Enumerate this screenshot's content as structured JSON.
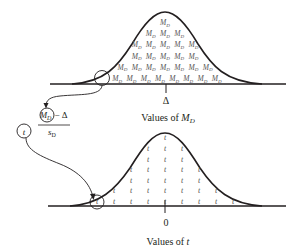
{
  "top_panel": {
    "name": "sampling-distribution-of-MD",
    "item_symbol": "M",
    "item_subscript": "D",
    "rows": [
      1,
      3,
      5,
      5,
      7,
      8
    ],
    "center_label": "Δ",
    "axis_label_prefix": "Values of ",
    "axis_label_var": "M",
    "axis_label_sub": "D"
  },
  "formula": {
    "numerator_var": "M",
    "numerator_sub": "D",
    "numerator_minus": "− Δ",
    "denominator_var": "s",
    "denominator_sub": "D",
    "result_symbol": "t"
  },
  "bottom_panel": {
    "name": "t-distribution",
    "item_symbol": "t",
    "column_heights": [
      1,
      2,
      4,
      6,
      7,
      6,
      4,
      2,
      1
    ],
    "center_label": "0",
    "axis_label_prefix": "Values of ",
    "axis_label_var": "t"
  },
  "colors": {
    "ink": "#231f20",
    "item_text": "#555555",
    "background": "#ffffff"
  }
}
